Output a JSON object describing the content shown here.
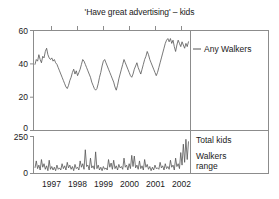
{
  "chart_data": {
    "type": "line",
    "title": "'Have great advertising' – kids",
    "xlabel": "",
    "ylabel": "",
    "grid": false,
    "legend_position": "right",
    "panels": [
      {
        "name": "upper-panel",
        "ylim": [
          0,
          62
        ],
        "yticks": [
          0,
          20,
          40,
          60
        ],
        "ytick_labels": [
          "0",
          "20",
          "40",
          "60"
        ],
        "legend": [
          {
            "label": "Any Walkers",
            "marker": "line",
            "color": "#555555"
          }
        ],
        "series": [
          {
            "name": "Any Walkers",
            "color": "#555555",
            "values": [
              41,
              44,
              43,
              47,
              44,
              42,
              46,
              45,
              49,
              51,
              47,
              45,
              44,
              45,
              43,
              44,
              42,
              41,
              39,
              37,
              35,
              33,
              31,
              29,
              27,
              26,
              28,
              31,
              33,
              36,
              38,
              35,
              37,
              34,
              36,
              38,
              41,
              44,
              43,
              41,
              39,
              37,
              35,
              33,
              30,
              28,
              26,
              25,
              26,
              29,
              33,
              36,
              40,
              43,
              44,
              42,
              40,
              38,
              36,
              34,
              32,
              30,
              27,
              25,
              28,
              32,
              35,
              38,
              41,
              44,
              42,
              40,
              38,
              36,
              34,
              33,
              35,
              38,
              40,
              42,
              39,
              37,
              35,
              38,
              41,
              44,
              46,
              49,
              47,
              44,
              42,
              40,
              38,
              36,
              34,
              36,
              39,
              42,
              45,
              48,
              51,
              54,
              56,
              57,
              55,
              57,
              54,
              56,
              52,
              49,
              53,
              56,
              54,
              52,
              55,
              53,
              51,
              54,
              52,
              55
            ]
          }
        ]
      },
      {
        "name": "lower-panel",
        "ylim": [
          0,
          265
        ],
        "yticks": [
          0,
          250
        ],
        "ytick_labels": [
          "0",
          "250"
        ],
        "legend": [
          {
            "label": "Total kids",
            "marker": "none",
            "color": "#555555"
          },
          {
            "label": "Walkers range",
            "marker": "line",
            "color": "#555555"
          }
        ],
        "series": [
          {
            "name": "Total kids",
            "color": "#555555",
            "values": [
              40,
              90,
              35,
              60,
              25,
              100,
              45,
              70,
              30,
              55,
              20,
              95,
              30,
              50,
              25,
              45,
              20,
              60,
              30,
              40,
              25,
              70,
              35,
              55,
              25,
              80,
              40,
              60,
              30,
              50,
              20,
              65,
              35,
              45,
              25,
              90,
              45,
              70,
              30,
              170,
              50,
              60,
              25,
              110,
              40,
              55,
              30,
              155,
              35,
              60,
              25,
              45,
              20,
              50,
              30,
              40,
              25,
              100,
              45,
              75,
              30,
              95,
              35,
              55,
              25,
              65,
              40,
              50,
              30,
              110,
              45,
              60,
              25,
              70,
              35,
              130,
              50,
              125,
              40,
              60,
              30,
              90,
              35,
              55,
              25,
              100,
              45,
              65,
              30,
              50,
              20,
              45,
              25,
              60,
              35,
              40,
              30,
              80,
              40,
              55,
              25,
              70,
              35,
              50,
              30,
              95,
              45,
              60,
              25,
              110,
              50,
              70,
              35,
              150,
              60,
              210,
              80,
              245,
              100,
              230
            ]
          }
        ]
      }
    ],
    "xaxis": {
      "tick_labels": [
        "1997",
        "1998",
        "1999",
        "2000",
        "2001",
        "2002"
      ],
      "tick_positions": [
        0.115,
        0.281,
        0.447,
        0.613,
        0.779,
        0.945
      ]
    }
  },
  "colors": {
    "line": "#555555",
    "axis": "#8c8c8c",
    "text": "#1a1a1a",
    "background": "#ffffff"
  }
}
